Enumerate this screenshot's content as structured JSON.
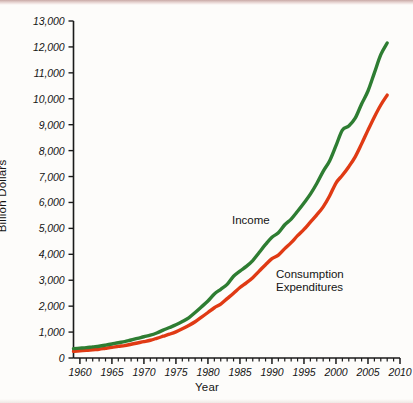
{
  "figure": {
    "background_color": "#fdfcfa",
    "width": 413,
    "height": 403
  },
  "axes": {
    "y_axis_title": "Billion Dollars",
    "x_axis_title": "Year",
    "y_tick_labels": [
      "13,000",
      "12,000",
      "11,000",
      "10,000",
      "9,000",
      "8,000",
      "7,000",
      "6,000",
      "5,000",
      "4,000",
      "3,000",
      "2,000",
      "1,000",
      "0"
    ],
    "x_tick_labels": [
      "1960",
      "1965",
      "1970",
      "1975",
      "1980",
      "1985",
      "1990",
      "1995",
      "2000",
      "2005",
      "2010"
    ]
  },
  "series_labels": {
    "income": "Income",
    "consumption_line1": "Consumption",
    "consumption_line2": "Expenditures"
  },
  "colors": {
    "income": "#2e7d32",
    "consumption": "#e03a14",
    "axis": "#1a1a1a",
    "text": "#141414",
    "background": "#fdfcfa"
  },
  "chart_data": {
    "type": "line",
    "title": "",
    "xlabel": "Year",
    "ylabel": "Billion Dollars",
    "xlim": [
      1959,
      2010
    ],
    "ylim": [
      0,
      13000
    ],
    "ytick_step": 1000,
    "xtick_major_step": 5,
    "xtick_minor_step": 1,
    "grid": false,
    "legend_position": "inline-annotations",
    "x": [
      1959,
      1960,
      1961,
      1962,
      1963,
      1964,
      1965,
      1966,
      1967,
      1968,
      1969,
      1970,
      1971,
      1972,
      1973,
      1974,
      1975,
      1976,
      1977,
      1978,
      1979,
      1980,
      1981,
      1982,
      1983,
      1984,
      1985,
      1986,
      1987,
      1988,
      1989,
      1990,
      1991,
      1992,
      1993,
      1994,
      1995,
      1996,
      1997,
      1998,
      1999,
      2000,
      2001,
      2002,
      2003,
      2004,
      2005,
      2006,
      2007,
      2008
    ],
    "series": [
      {
        "name": "Income",
        "color": "#2e7d32",
        "values": [
          360,
          380,
          400,
          430,
          455,
          495,
          540,
          590,
          630,
          695,
          755,
          820,
          880,
          965,
          1075,
          1175,
          1280,
          1405,
          1550,
          1755,
          1975,
          2200,
          2470,
          2650,
          2840,
          3155,
          3355,
          3535,
          3760,
          4070,
          4380,
          4660,
          4830,
          5140,
          5360,
          5660,
          5980,
          6320,
          6730,
          7200,
          7600,
          8190,
          8790,
          8950,
          9250,
          9800,
          10300,
          11000,
          11700,
          12150
        ]
      },
      {
        "name": "Consumption Expenditures",
        "color": "#e03a14",
        "values": [
          260,
          280,
          295,
          320,
          340,
          375,
          410,
          450,
          480,
          530,
          580,
          630,
          685,
          760,
          840,
          920,
          1010,
          1125,
          1255,
          1400,
          1575,
          1755,
          1940,
          2080,
          2290,
          2500,
          2720,
          2900,
          3100,
          3350,
          3600,
          3830,
          3970,
          4220,
          4450,
          4720,
          4960,
          5240,
          5520,
          5830,
          6250,
          6750,
          7050,
          7380,
          7760,
          8260,
          8790,
          9300,
          9760,
          10140
        ]
      }
    ]
  }
}
